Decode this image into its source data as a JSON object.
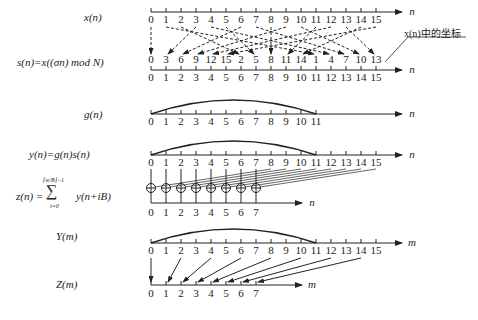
{
  "labels": {
    "xn": "x(n)",
    "sn": "s(n)=x((σn) mod N)",
    "gn": "g(n)",
    "yn": "y(n)=g(n)s(n)",
    "zn_left": "z(n) =",
    "zn_upper": "⌈w/B⌉−1",
    "zn_sigma": "∑",
    "zn_lower": "i=0",
    "zn_right": "y(n+iB)",
    "Ym": "Y(m)",
    "Zm": "Z(m)",
    "annotation": "x(n)中的坐标"
  },
  "axes": {
    "n_label": "n",
    "m_label": "m",
    "ticks16": [
      "0",
      "1",
      "2",
      "3",
      "4",
      "5",
      "6",
      "7",
      "8",
      "9",
      "10",
      "11",
      "12",
      "13",
      "14",
      "15"
    ],
    "ticks12": [
      "0",
      "1",
      "2",
      "3",
      "4",
      "5",
      "6",
      "7",
      "8",
      "9",
      "10",
      "11"
    ],
    "ticks8": [
      "0",
      "1",
      "2",
      "3",
      "4",
      "5",
      "6",
      "7"
    ],
    "permuted": [
      "0",
      "3",
      "6",
      "9",
      "12",
      "15",
      "2",
      "5",
      "8",
      "11",
      "14",
      "1",
      "4",
      "7",
      "10",
      "13"
    ]
  },
  "chart_data": {
    "type": "diagram",
    "N": 16,
    "B": 8,
    "sigma": 3,
    "window_support": [
      0,
      11
    ],
    "permutation_map": [
      0,
      3,
      6,
      9,
      12,
      15,
      2,
      5,
      8,
      11,
      14,
      1,
      4,
      7,
      10,
      13
    ],
    "rows": [
      "x(n)",
      "s(n)",
      "g(n)",
      "y(n)",
      "z(n)",
      "Y(m)",
      "Z(m)"
    ],
    "subsample_map_Y_to_Z": [
      [
        0,
        0
      ],
      [
        2,
        1
      ],
      [
        4,
        2
      ],
      [
        6,
        3
      ],
      [
        8,
        4
      ],
      [
        10,
        5
      ],
      [
        12,
        6
      ],
      [
        14,
        7
      ]
    ]
  }
}
